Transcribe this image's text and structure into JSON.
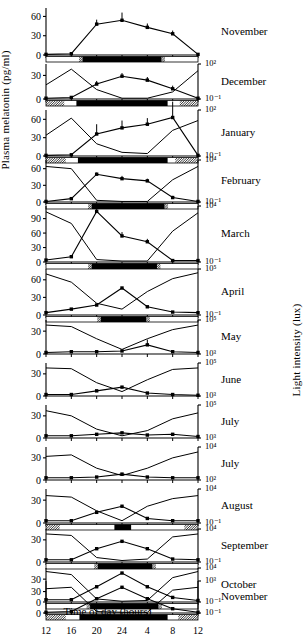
{
  "axes": {
    "ylabel_left": "Plasma melatonin (pg/ml)",
    "ylabel_right": "Light intensity (lux)",
    "xlabel": "Time of day (hours)",
    "xticks": [
      "12",
      "16",
      "20",
      "24",
      "4",
      "8",
      "12"
    ]
  },
  "chart_data": {
    "type": "line",
    "title": "",
    "xlabel": "Time of day (hours)",
    "ylabel": "Plasma melatonin (pg/ml)",
    "ylabel_secondary": "Light intensity (lux)",
    "x": [
      12,
      16,
      20,
      24,
      4,
      8,
      12
    ],
    "xlim": [
      10,
      14
    ],
    "grid": false,
    "legend": "none",
    "panels": [
      {
        "month": "November",
        "ylim": [
          0,
          70
        ],
        "yticks": [
          0,
          30,
          60
        ],
        "right_top": "",
        "right_bottom": "",
        "melatonin": [
          1,
          2,
          48,
          54,
          43,
          33,
          1
        ],
        "errors": [
          0,
          0,
          7,
          12,
          6,
          5,
          0
        ],
        "light": [],
        "dark_start": 0.24,
        "dark_end": 0.76,
        "twilight_left": 0.045,
        "twilight_right": 0.045,
        "bar_style": "grey-ends"
      },
      {
        "month": "December",
        "ylim": [
          0,
          42
        ],
        "yticks": [
          0,
          30
        ],
        "right_top": "10²",
        "right_bottom": "10⁻¹",
        "melatonin": [
          1,
          2,
          19,
          29,
          24,
          13,
          1
        ],
        "errors": [
          0,
          0,
          4,
          4,
          4,
          4,
          0
        ],
        "light": [
          18,
          38,
          12,
          1,
          1,
          9,
          36
        ],
        "dark_start": 0.2,
        "dark_end": 0.8,
        "twilight_left": 0.12,
        "twilight_right": 0.12,
        "bar_style": "hatched-ends"
      },
      {
        "month": "January",
        "ylim": [
          0,
          72
        ],
        "yticks": [
          0,
          30,
          60
        ],
        "right_top": "10²",
        "right_bottom": "10⁻¹",
        "melatonin": [
          1,
          2,
          36,
          46,
          52,
          63,
          1
        ],
        "errors": [
          0,
          0,
          16,
          12,
          10,
          26,
          0
        ],
        "light": [
          34,
          62,
          20,
          6,
          4,
          42,
          58
        ],
        "dark_start": 0.21,
        "dark_end": 0.8,
        "twilight_left": 0.13,
        "twilight_right": 0.15,
        "bar_style": "hatched-ends"
      },
      {
        "month": "February",
        "ylim": [
          0,
          72
        ],
        "yticks": [
          0,
          30,
          60
        ],
        "right_top": "10⁴",
        "right_bottom": "10⁻¹",
        "melatonin": [
          1,
          6,
          50,
          42,
          38,
          8,
          1
        ],
        "errors": [
          0,
          0,
          3,
          5,
          4,
          3,
          0
        ],
        "light": [
          64,
          60,
          3,
          1,
          1,
          40,
          64
        ],
        "dark_start": 0.3,
        "dark_end": 0.78,
        "twilight_left": 0.02,
        "twilight_right": 0.02,
        "bar_style": "grey-ends"
      },
      {
        "month": "March",
        "ylim": [
          0,
          112
        ],
        "yticks": [
          0,
          30,
          60,
          90
        ],
        "right_top": "10⁴",
        "right_bottom": "10⁻¹",
        "melatonin": [
          4,
          11,
          105,
          54,
          42,
          3,
          3
        ],
        "errors": [
          0,
          0,
          8,
          8,
          6,
          0,
          0
        ],
        "light": [
          104,
          80,
          5,
          2,
          2,
          64,
          102
        ],
        "dark_start": 0.3,
        "dark_end": 0.73,
        "twilight_left": 0.03,
        "twilight_right": 0.03,
        "bar_style": "grey-ends"
      },
      {
        "month": "April",
        "ylim": [
          0,
          75
        ],
        "yticks": [
          0,
          30,
          60
        ],
        "right_top": "10⁵",
        "right_bottom": "10⁻¹",
        "melatonin": [
          4,
          10,
          17,
          46,
          14,
          5,
          4
        ],
        "errors": [
          0,
          0,
          0,
          0,
          0,
          0,
          0
        ],
        "light": [
          70,
          56,
          20,
          10,
          40,
          62,
          72
        ],
        "dark_start": 0.36,
        "dark_end": 0.66,
        "twilight_left": 0.03,
        "twilight_right": 0.03,
        "bar_style": "grey-ends"
      },
      {
        "month": "May",
        "ylim": [
          0,
          42
        ],
        "yticks": [
          0,
          30
        ],
        "right_top": "10⁵",
        "right_bottom": "10³",
        "melatonin": [
          2,
          3,
          3,
          4,
          12,
          3,
          2
        ],
        "errors": [
          0,
          0,
          0,
          0,
          7,
          0,
          0
        ],
        "light": [
          38,
          36,
          20,
          6,
          20,
          32,
          38
        ],
        "dark_start": 0,
        "dark_end": 0,
        "twilight_left": 0,
        "twilight_right": 0,
        "bar_style": "none"
      },
      {
        "month": "June",
        "ylim": [
          0,
          42
        ],
        "yticks": [
          0,
          30
        ],
        "right_top": "10⁵",
        "right_bottom": "10³",
        "melatonin": [
          2,
          2,
          7,
          12,
          4,
          2,
          1
        ],
        "errors": [
          0,
          0,
          0,
          0,
          0,
          0,
          0
        ],
        "light": [
          38,
          37,
          18,
          6,
          22,
          36,
          38
        ],
        "dark_start": 0,
        "dark_end": 0,
        "twilight_left": 0,
        "twilight_right": 0,
        "bar_style": "none"
      },
      {
        "month": "July",
        "ylim": [
          0,
          42
        ],
        "yticks": [
          0,
          30
        ],
        "right_top": "10⁵",
        "right_bottom": "10³",
        "melatonin": [
          3,
          3,
          5,
          7,
          4,
          5,
          2
        ],
        "errors": [
          0,
          0,
          0,
          0,
          0,
          0,
          0
        ],
        "light": [
          37,
          30,
          12,
          3,
          10,
          26,
          34
        ],
        "dark_start": 0,
        "dark_end": 0,
        "twilight_left": 0,
        "twilight_right": 0,
        "bar_style": "none"
      },
      {
        "month": "July",
        "ylim": [
          0,
          42
        ],
        "yticks": [
          0,
          30
        ],
        "right_top": "10⁴",
        "right_bottom": "10²",
        "melatonin": [
          3,
          3,
          4,
          8,
          4,
          3,
          3
        ],
        "errors": [
          0,
          0,
          0,
          0,
          0,
          0,
          0
        ],
        "light": [
          32,
          34,
          16,
          6,
          16,
          30,
          38
        ],
        "dark_start": 0,
        "dark_end": 0,
        "twilight_left": 0,
        "twilight_right": 0,
        "bar_style": "none"
      },
      {
        "month": "August",
        "ylim": [
          0,
          42
        ],
        "yticks": [
          0,
          30
        ],
        "right_top": "10⁴",
        "right_bottom": "10⁻¹",
        "melatonin": [
          3,
          3,
          14,
          22,
          6,
          3,
          3
        ],
        "errors": [
          0,
          0,
          0,
          0,
          0,
          0,
          0
        ],
        "light": [
          36,
          34,
          16,
          3,
          22,
          32,
          36
        ],
        "dark_start": 0.45,
        "dark_end": 0.56,
        "twilight_left": 0.09,
        "twilight_right": 0.09,
        "bar_style": "hatched-ends"
      },
      {
        "month": "September",
        "ylim": [
          0,
          42
        ],
        "yticks": [
          0,
          30
        ],
        "right_top": "10⁴",
        "right_bottom": "10⁻¹",
        "melatonin": [
          3,
          3,
          18,
          28,
          18,
          4,
          3
        ],
        "errors": [
          0,
          0,
          0,
          0,
          0,
          0,
          0
        ],
        "light": [
          38,
          36,
          6,
          2,
          4,
          34,
          38
        ],
        "dark_start": 0.34,
        "dark_end": 0.7,
        "twilight_left": 0.04,
        "twilight_right": 0.04,
        "bar_style": "grey-ends"
      },
      {
        "month": "October",
        "ylim": [
          0,
          42
        ],
        "yticks": [
          0,
          30
        ],
        "right_top": "10⁴",
        "right_bottom": "10⁻¹",
        "melatonin": [
          3,
          3,
          20,
          38,
          20,
          6,
          2
        ],
        "errors": [
          0,
          0,
          0,
          0,
          0,
          0,
          0
        ],
        "light": [
          40,
          36,
          4,
          1,
          2,
          32,
          40
        ],
        "dark_start": 0.29,
        "dark_end": 0.74,
        "twilight_left": 0.03,
        "twilight_right": 0.03,
        "bar_style": "grey-ends"
      },
      {
        "month": "November",
        "ylim": [
          0,
          42
        ],
        "yticks": [
          0,
          30
        ],
        "right_top": "10³",
        "right_bottom": "10⁻¹",
        "melatonin": [
          1,
          2,
          20,
          36,
          20,
          6,
          1
        ],
        "errors": [
          0,
          0,
          0,
          0,
          0,
          0,
          0
        ],
        "light": [
          34,
          36,
          2,
          1,
          1,
          32,
          36
        ],
        "dark_start": 0.22,
        "dark_end": 0.8,
        "twilight_left": 0.13,
        "twilight_right": 0.13,
        "bar_style": "hatched-ends"
      }
    ]
  }
}
